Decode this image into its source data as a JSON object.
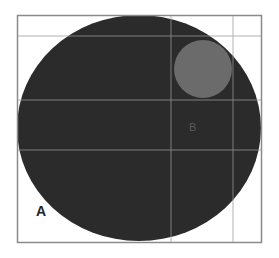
{
  "diagram": {
    "labels": {
      "a": "A",
      "b": "B"
    },
    "colors": {
      "background": "#ffffff",
      "frame": "#8a8a8a",
      "grid": "#9a9a9a",
      "large_circle": "#2b2b2b",
      "small_circle": "#6b6b6b",
      "label_a": "#222222",
      "label_b": "#5a5a5a"
    },
    "frame": {
      "x": 17,
      "y": 15,
      "width": 244,
      "height": 227
    },
    "grid_lines": {
      "horizontal_y": [
        36,
        100,
        150
      ],
      "vertical_x": [
        171,
        233
      ]
    },
    "large_circle": {
      "cx": 139,
      "cy": 128,
      "rx": 122,
      "ry": 113
    },
    "small_circle": {
      "cx": 203,
      "cy": 69,
      "r": 29
    },
    "label_positions": {
      "a": {
        "x": 36,
        "y": 215
      },
      "b": {
        "x": 189,
        "y": 131
      }
    }
  }
}
